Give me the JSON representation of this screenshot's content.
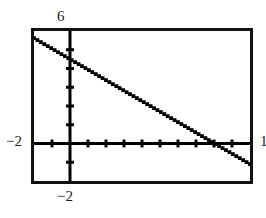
{
  "figure": {
    "background_color": "#ffffff",
    "frame_color": "#111111",
    "plot_color": "#000000"
  },
  "labels": {
    "y_max": "6",
    "y_min": "−2",
    "x_min": "−2",
    "x_max": "1"
  },
  "chart_data": {
    "type": "line",
    "title": "",
    "subtitle": "",
    "xlabel": "",
    "ylabel": "",
    "xlim": [
      -2,
      10
    ],
    "ylim": [
      -2,
      6
    ],
    "xticks": [
      -2,
      -1,
      0,
      1,
      2,
      3,
      4,
      5,
      6,
      7,
      8,
      9,
      10
    ],
    "yticks": [
      -2,
      -1,
      0,
      1,
      2,
      3,
      4,
      5,
      6
    ],
    "xtick_labels": [
      "−2",
      "",
      "",
      "",
      "",
      "",
      "",
      "",
      "",
      "",
      "",
      "",
      "1"
    ],
    "ytick_labels": [
      "−2",
      "",
      "",
      "",
      "",
      "",
      "",
      "",
      "6"
    ],
    "grid": false,
    "legend": null,
    "legend_position": "none",
    "axes_style": "centered-crosshair",
    "line_style": "dotted-pixel-trace",
    "series": [
      {
        "name": "line",
        "equation": "y = -0.56x + 4.5",
        "slope": -0.56,
        "y_intercept": 4.5,
        "x_intercept": 8.0,
        "x": [
          -2,
          10
        ],
        "values": [
          5.62,
          -1.1
        ]
      }
    ],
    "annotations": []
  }
}
